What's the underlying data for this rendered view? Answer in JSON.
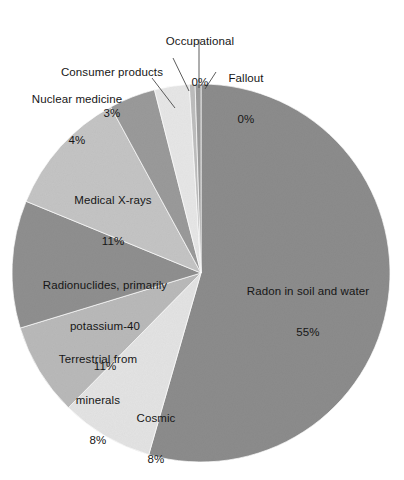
{
  "chart_data": {
    "type": "pie",
    "title": "",
    "subtitle": "",
    "xlabel": "",
    "ylabel": "",
    "legend_position": "none",
    "grid": false,
    "units": "percent of total radiation exposure",
    "start_angle_deg": 0,
    "direction": "clockwise",
    "categories": [
      "Radon in soil and water",
      "Cosmic",
      "Terrestrial from minerals",
      "Radionuclides, primarily potassium-40",
      "Medical X-rays",
      "Nuclear medicine",
      "Consumer products",
      "Occupational",
      "Fallout"
    ],
    "values": [
      55,
      8,
      8,
      11,
      11,
      4,
      3,
      0.5,
      0.5
    ],
    "value_labels": [
      "55%",
      "8%",
      "8%",
      "11%",
      "11%",
      "4%",
      "3%",
      "0%",
      "0%"
    ],
    "colors": [
      "#8c8c8c",
      "#e3e3e3",
      "#b9b9b9",
      "#8f8f8f",
      "#c4c4c4",
      "#9a9a9a",
      "#e6e6e6",
      "#bdbdbd",
      "#9c9c9c"
    ],
    "slices": [
      {
        "name": "Radon in soil and water",
        "value": 55,
        "value_label": "55%",
        "label_lines": [
          "Radon in soil and water",
          "55%"
        ],
        "color": "#8c8c8c",
        "label_placement": "inside"
      },
      {
        "name": "Cosmic",
        "value": 8,
        "value_label": "8%",
        "label_lines": [
          "Cosmic",
          "8%"
        ],
        "color": "#e3e3e3",
        "label_placement": "inside"
      },
      {
        "name": "Terrestrial from minerals",
        "value": 8,
        "value_label": "8%",
        "label_lines": [
          "Terrestrial from",
          "minerals",
          "8%"
        ],
        "color": "#b9b9b9",
        "label_placement": "inside"
      },
      {
        "name": "Radionuclides, primarily potassium-40",
        "value": 11,
        "value_label": "11%",
        "label_lines": [
          "Radionuclides, primarily",
          "potassium-40",
          "11%"
        ],
        "color": "#8f8f8f",
        "label_placement": "inside"
      },
      {
        "name": "Medical X-rays",
        "value": 11,
        "value_label": "11%",
        "label_lines": [
          "Medical X-rays",
          "11%"
        ],
        "color": "#c4c4c4",
        "label_placement": "inside"
      },
      {
        "name": "Nuclear medicine",
        "value": 4,
        "value_label": "4%",
        "label_lines": [
          "Nuclear medicine",
          "4%"
        ],
        "color": "#9a9a9a",
        "label_placement": "outside-left",
        "has_leader_line": true
      },
      {
        "name": "Consumer products",
        "value": 3,
        "value_label": "3%",
        "label_lines": [
          "Consumer products",
          "3%"
        ],
        "color": "#e6e6e6",
        "label_placement": "outside-top-left",
        "has_leader_line": true
      },
      {
        "name": "Occupational",
        "value": 0.5,
        "value_label": "0%",
        "label_lines": [
          "Occupational",
          "0%"
        ],
        "color": "#bdbdbd",
        "label_placement": "outside-top",
        "has_leader_line": true
      },
      {
        "name": "Fallout",
        "value": 0.5,
        "value_label": "0%",
        "label_lines": [
          "Fallout",
          "0%"
        ],
        "color": "#9c9c9c",
        "label_placement": "outside-top-right",
        "has_leader_line": true
      }
    ]
  },
  "labels": {
    "radon": {
      "name": "Radon in soil and water",
      "pct": "55%"
    },
    "cosmic": {
      "name": "Cosmic",
      "pct": "8%"
    },
    "terrestrial": {
      "name_line1": "Terrestrial from",
      "name_line2": "minerals",
      "pct": "8%"
    },
    "radionuclides": {
      "name_line1": "Radionuclides, primarily",
      "name_line2": "potassium-40",
      "pct": "11%"
    },
    "medical_xrays": {
      "name": "Medical X-rays",
      "pct": "11%"
    },
    "nuclear_medicine": {
      "name": "Nuclear medicine",
      "pct": "4%"
    },
    "consumer_products": {
      "name": "Consumer products",
      "pct": "3%"
    },
    "occupational": {
      "name": "Occupational",
      "pct": "0%"
    },
    "fallout": {
      "name": "Fallout",
      "pct": "0%"
    }
  }
}
